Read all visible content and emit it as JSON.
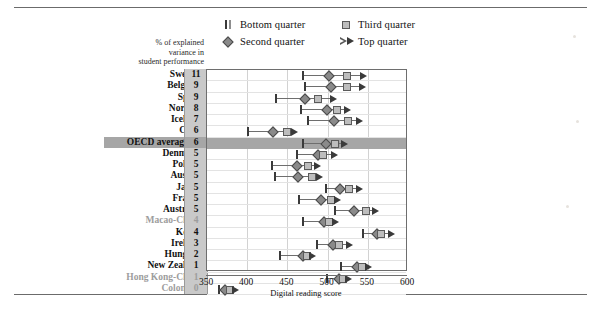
{
  "legend": {
    "items": [
      {
        "label": "Bottom quarter",
        "glyph": "bar-pair-icon"
      },
      {
        "label": "Third quarter",
        "glyph": "square-icon"
      },
      {
        "label": "Second quarter",
        "glyph": "diamond-icon"
      },
      {
        "label": "Top quarter",
        "glyph": "triangle-pair-icon"
      }
    ]
  },
  "axis_caption": "% of explained\nvariance in\nstudent performance",
  "axis_caption_lines": [
    "% of explained",
    "variance in",
    "student performance"
  ],
  "xaxis": {
    "title": "Digital reading score",
    "ticks": [
      350,
      400,
      450,
      500,
      550,
      600
    ],
    "min": 350,
    "max": 600
  },
  "chart_data": {
    "type": "scatter",
    "title": "",
    "xlabel": "Digital reading score",
    "ylabel": "",
    "xlim": [
      350,
      600
    ],
    "grid": true,
    "legend_position": "top",
    "series": [
      {
        "name": "Bottom quarter",
        "marker": "bar"
      },
      {
        "name": "Second quarter",
        "marker": "diamond"
      },
      {
        "name": "Third quarter",
        "marker": "square"
      },
      {
        "name": "Top quarter",
        "marker": "triangle"
      }
    ],
    "value_column_header": "% of explained variance in student performance",
    "categories": [
      "Sweden",
      "Belgium",
      "Spain",
      "Norway",
      "Iceland",
      "Chile",
      "OECD average-16",
      "Denmark",
      "Poland",
      "Austria",
      "Japan",
      "France",
      "Australia",
      "Macao-China",
      "Korea",
      "Ireland",
      "Hungary",
      "New Zealand",
      "Hong Kong-China",
      "Colombia"
    ],
    "rows": [
      {
        "country": "Sweden",
        "variance": 11,
        "dim": false,
        "highlight": false,
        "bottom": 469,
        "second": 502,
        "third": 524,
        "top": 543
      },
      {
        "country": "Belgium",
        "variance": 9,
        "dim": false,
        "highlight": false,
        "bottom": 472,
        "second": 504,
        "third": 524,
        "top": 541
      },
      {
        "country": "Spain",
        "variance": 9,
        "dim": false,
        "highlight": false,
        "bottom": 436,
        "second": 472,
        "third": 488,
        "top": 506
      },
      {
        "country": "Norway",
        "variance": 8,
        "dim": false,
        "highlight": false,
        "bottom": 467,
        "second": 499,
        "third": 512,
        "top": 523
      },
      {
        "country": "Iceland",
        "variance": 7,
        "dim": false,
        "highlight": false,
        "bottom": 476,
        "second": 508,
        "third": 525,
        "top": 538
      },
      {
        "country": "Chile",
        "variance": 6,
        "dim": false,
        "highlight": false,
        "bottom": 401,
        "second": 432,
        "third": 449,
        "top": 457
      },
      {
        "country": "OECD average-16",
        "variance": 6,
        "dim": false,
        "highlight": true,
        "bottom": 469,
        "second": 498,
        "third": 509,
        "top": 519
      },
      {
        "country": "Denmark",
        "variance": 5,
        "dim": false,
        "highlight": false,
        "bottom": 462,
        "second": 488,
        "third": 494,
        "top": 507
      },
      {
        "country": "Poland",
        "variance": 5,
        "dim": false,
        "highlight": false,
        "bottom": 431,
        "second": 462,
        "third": 476,
        "top": 486
      },
      {
        "country": "Austria",
        "variance": 5,
        "dim": false,
        "highlight": false,
        "bottom": 434,
        "second": 463,
        "third": 481,
        "top": 488
      },
      {
        "country": "Japan",
        "variance": 5,
        "dim": false,
        "highlight": false,
        "bottom": 498,
        "second": 515,
        "third": 527,
        "top": 538
      },
      {
        "country": "France",
        "variance": 5,
        "dim": false,
        "highlight": false,
        "bottom": 464,
        "second": 492,
        "third": 504,
        "top": 510
      },
      {
        "country": "Australia",
        "variance": 5,
        "dim": false,
        "highlight": false,
        "bottom": 509,
        "second": 533,
        "third": 548,
        "top": 558
      },
      {
        "country": "Macao-China",
        "variance": 4,
        "dim": true,
        "highlight": false,
        "bottom": 469,
        "second": 495,
        "third": 502,
        "top": 508
      },
      {
        "country": "Korea",
        "variance": 4,
        "dim": false,
        "highlight": false,
        "bottom": 544,
        "second": 561,
        "third": 567,
        "top": 578
      },
      {
        "country": "Ireland",
        "variance": 3,
        "dim": false,
        "highlight": false,
        "bottom": 487,
        "second": 507,
        "third": 514,
        "top": 525
      },
      {
        "country": "Hungary",
        "variance": 2,
        "dim": false,
        "highlight": false,
        "bottom": 441,
        "second": 469,
        "third": 474,
        "top": 479
      },
      {
        "country": "New Zealand",
        "variance": 1,
        "dim": false,
        "highlight": false,
        "bottom": 517,
        "second": 537,
        "third": 543,
        "top": 549
      },
      {
        "country": "Hong Kong-China",
        "variance": 1,
        "dim": true,
        "highlight": false,
        "bottom": 499,
        "second": 514,
        "third": 519,
        "top": 524
      },
      {
        "country": "Colombia",
        "variance": 0,
        "dim": true,
        "highlight": false,
        "bottom": 365,
        "second": 372,
        "third": 378,
        "top": 384
      }
    ]
  }
}
